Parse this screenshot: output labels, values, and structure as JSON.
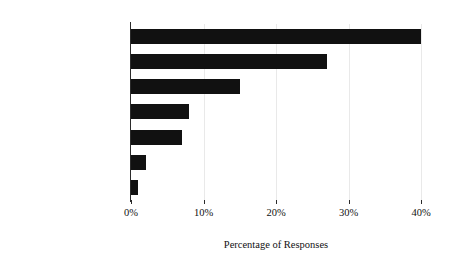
{
  "chart_data": {
    "type": "bar",
    "orientation": "horizontal",
    "title": "",
    "xlabel": "Percentage of Responses",
    "ylabel": "Types of Formal Training",
    "categories": [
      "Degree",
      "Certificate",
      "Training",
      "Pastoral",
      "License",
      "Other job",
      "Other ministry"
    ],
    "values": [
      40,
      27,
      15,
      8,
      7,
      2,
      1
    ],
    "xlim": [
      0,
      40
    ],
    "xticks": [
      0,
      10,
      20,
      30,
      40
    ],
    "xtick_labels": [
      "0%",
      "10%",
      "20%",
      "30%",
      "40%"
    ],
    "grid": "vertical-light",
    "legend": "none",
    "bar_color": "#111111",
    "axis_color": "#2b2b2b",
    "gridline_color": "#e9e9e9",
    "background_color": "#ffffff"
  }
}
